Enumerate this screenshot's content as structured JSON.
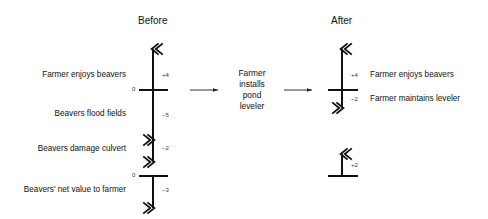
{
  "before": {
    "title": "Before",
    "labels": {
      "enjoy": "Farmer enjoys beavers",
      "flood": "Beavers flood fields",
      "culvert": "Beavers damage culvert",
      "net": "Beavers' net value to farmer"
    },
    "values": {
      "enjoy": "+4",
      "flood": "−5",
      "culvert": "−2",
      "net": "−3",
      "zero_top": "0",
      "zero_bottom": "0"
    }
  },
  "middle": {
    "line1": "Farmer",
    "line2": "installs",
    "line3": "pond",
    "line4": "leveler"
  },
  "after": {
    "title": "After",
    "labels": {
      "enjoy": "Farmer enjoys beavers",
      "maintain": "Farmer maintains leveler"
    },
    "values": {
      "enjoy": "+4",
      "maintain": "−2",
      "net": "+2"
    }
  },
  "colors": {
    "line": "#111111",
    "text": "#111111"
  }
}
